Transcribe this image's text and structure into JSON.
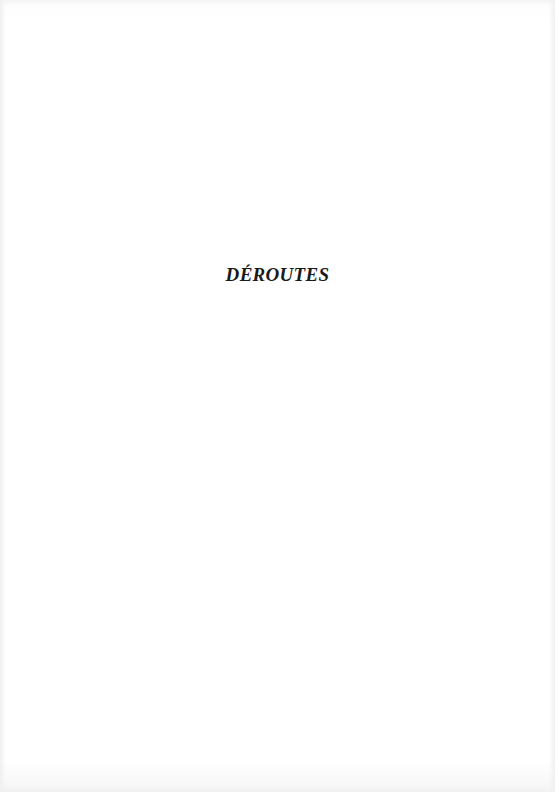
{
  "page": {
    "title": "DÉROUTES",
    "background_color": "#ffffff",
    "text_color": "#1a1a1a"
  }
}
